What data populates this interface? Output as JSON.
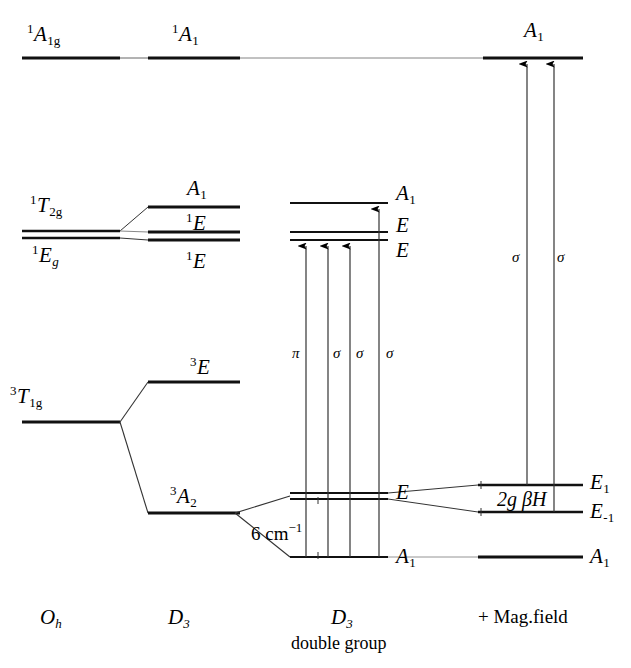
{
  "columns": [
    {
      "name": "col-oh",
      "label_main": "O",
      "label_sub": "h",
      "sublabel": "",
      "x": 55
    },
    {
      "name": "col-d3",
      "label_main": "D",
      "label_sub": "3",
      "sublabel": "",
      "x": 182
    },
    {
      "name": "col-d3-double",
      "label_main": "D",
      "label_sub": "3",
      "sublabel": "double group",
      "x": 345
    },
    {
      "name": "col-magfield",
      "label_main": "+ Mag.field",
      "label_sub": "",
      "sublabel": "",
      "x": 522
    }
  ],
  "levels": {
    "oh": [
      {
        "id": "oh-a1g",
        "pre": "1",
        "main": "A",
        "sub": "1g",
        "label_x": 27,
        "label_y": 22,
        "y": 58,
        "x1": 22,
        "x2": 120
      },
      {
        "id": "oh-t2g",
        "pre": "1",
        "main": "T",
        "sub": "2g",
        "label_x": 30,
        "label_y": 193,
        "y": 231,
        "x1": 22,
        "x2": 120
      },
      {
        "id": "oh-eg",
        "pre": "1",
        "main": "E",
        "sub": "g",
        "label_x": 32,
        "label_y": 243,
        "y": 238,
        "x1": 22,
        "x2": 120
      },
      {
        "id": "oh-t1g",
        "pre": "3",
        "main": "T",
        "sub": "1g",
        "label_x": 10,
        "label_y": 384,
        "y": 422,
        "x1": 22,
        "x2": 120
      }
    ],
    "d3": [
      {
        "id": "d3-a1",
        "pre": "1",
        "main": "A",
        "sub": "1",
        "label_x": 172,
        "label_y": 22,
        "y": 58,
        "x1": 148,
        "x2": 240
      },
      {
        "id": "d3-a1b",
        "pre": "",
        "main": "A",
        "sub": "1",
        "label_x": 187,
        "label_y": 178,
        "y": 207,
        "x1": 148,
        "x2": 240
      },
      {
        "id": "d3-e1",
        "pre": "1",
        "main": "E",
        "sub": "",
        "label_x": 186,
        "label_y": 211,
        "y": 232,
        "x1": 148,
        "x2": 240
      },
      {
        "id": "d3-e2",
        "pre": "1",
        "main": "E",
        "sub": "",
        "label_x": 186,
        "label_y": 249,
        "y": 240,
        "x1": 148,
        "x2": 240
      },
      {
        "id": "d3-e3",
        "pre": "3",
        "main": "E",
        "sub": "",
        "label_x": 190,
        "label_y": 355,
        "y": 382,
        "x1": 148,
        "x2": 240
      },
      {
        "id": "d3-a2",
        "pre": "3",
        "main": "A",
        "sub": "2",
        "label_x": 170,
        "label_y": 484,
        "y": 513,
        "x1": 148,
        "x2": 240
      }
    ],
    "d3double": [
      {
        "id": "dg-a1top",
        "pre": "",
        "main": "A",
        "sub": "1",
        "label_x": 396,
        "label_y": 183,
        "y": 203,
        "x1": 290,
        "x2": 388
      },
      {
        "id": "dg-e-up",
        "pre": "",
        "main": "E",
        "sub": "",
        "label_x": 396,
        "label_y": 215,
        "y": 232,
        "x1": 290,
        "x2": 388
      },
      {
        "id": "dg-e-lo",
        "pre": "",
        "main": "E",
        "sub": "",
        "label_x": 396,
        "label_y": 240,
        "y": 240,
        "x1": 290,
        "x2": 388
      },
      {
        "id": "dg-e-gs1",
        "pre": "",
        "main": "E",
        "sub": "",
        "label_x": 396,
        "label_y": 482,
        "y": 493,
        "x1": 290,
        "x2": 388
      },
      {
        "id": "dg-e-gs2",
        "pre": "",
        "main": "",
        "sub": "",
        "label_x": 0,
        "label_y": 0,
        "y": 499,
        "x1": 290,
        "x2": 388
      },
      {
        "id": "dg-a1bot",
        "pre": "",
        "main": "A",
        "sub": "1",
        "label_x": 396,
        "label_y": 546,
        "y": 557,
        "x1": 290,
        "x2": 388
      }
    ],
    "magfield": [
      {
        "id": "mf-a1top",
        "pre": "",
        "main": "A",
        "sub": "1",
        "label_x": 524,
        "label_y": 20,
        "y": 58,
        "x1": 483,
        "x2": 583
      },
      {
        "id": "mf-e1",
        "pre": "",
        "main": "E",
        "sub": "1",
        "label_x": 590,
        "label_y": 472,
        "y": 485,
        "x1": 478,
        "x2": 583
      },
      {
        "id": "mf-em1",
        "pre": "",
        "main": "E",
        "sub": "-1",
        "label_x": 590,
        "label_y": 501,
        "y": 512,
        "x1": 478,
        "x2": 583
      },
      {
        "id": "mf-a1bot",
        "pre": "",
        "main": "A",
        "sub": "1",
        "label_x": 590,
        "label_y": 546,
        "y": 557,
        "x1": 478,
        "x2": 583
      }
    ]
  },
  "transitions": {
    "double_group": [
      {
        "name": "transition-pi",
        "label": "π",
        "x": 306,
        "y_from": 557,
        "y_to": 244,
        "label_x": 292,
        "label_y": 346
      },
      {
        "name": "transition-sigma-1",
        "label": "σ",
        "x": 328,
        "y_from": 557,
        "y_to": 244,
        "label_x": 333,
        "label_y": 346
      },
      {
        "name": "transition-sigma-2",
        "label": "σ",
        "x": 350,
        "y_from": 557,
        "y_to": 244,
        "label_x": 356,
        "label_y": 346
      },
      {
        "name": "transition-sigma-3",
        "label": "σ",
        "x": 379,
        "y_from": 557,
        "y_to": 207,
        "label_x": 386,
        "label_y": 346
      }
    ],
    "magfield": [
      {
        "name": "transition-sigma-mag-1",
        "label": "σ",
        "x": 527,
        "y_from": 485,
        "y_to": 62,
        "label_x": 512,
        "label_y": 250
      },
      {
        "name": "transition-sigma-mag-2",
        "label": "σ",
        "x": 554,
        "y_from": 512,
        "y_to": 62,
        "label_x": 557,
        "label_y": 250
      }
    ]
  },
  "annotations": {
    "splitting_energy": {
      "value": "6 cm",
      "exponent": "−1",
      "x": 251,
      "y": 521
    },
    "zeeman_splitting": {
      "text": "2g βH",
      "x": 497,
      "y": 489
    }
  }
}
